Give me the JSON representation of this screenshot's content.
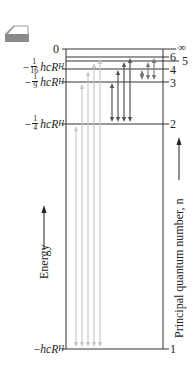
{
  "icon": {
    "name": "book-icon",
    "color": "#8a8a8a"
  },
  "diagram": {
    "frame": {
      "left": 66,
      "right": 163,
      "top": 49,
      "bottom": 349
    },
    "levels": [
      {
        "n": "∞",
        "energy_label": "0",
        "y": 49,
        "label_y": 43
      },
      {
        "n": "6",
        "energy_label": "",
        "y": 57,
        "label_y": 51
      },
      {
        "n": "5",
        "energy_label": "",
        "y": 61,
        "label_y": 56
      },
      {
        "n": "4",
        "energy_label": "−1/16 hcR_H",
        "y": 69,
        "label_y": 64
      },
      {
        "n": "3",
        "energy_label": "−1/9 hcR_H",
        "y": 82,
        "label_y": 77
      },
      {
        "n": "2",
        "energy_label": "−1/4 hcR_H",
        "y": 124,
        "label_y": 118
      },
      {
        "n": "1",
        "energy_label": "−hcR_H",
        "y": 349,
        "label_y": 343
      }
    ],
    "energy_labels": {
      "zero": "0",
      "n4": {
        "sign": "−",
        "num": "1",
        "den": "16",
        "text": "hcR",
        "sub": "H"
      },
      "n3": {
        "sign": "−",
        "num": "1",
        "den": "9",
        "text": "hcR",
        "sub": "H"
      },
      "n2": {
        "sign": "−",
        "num": "1",
        "den": "4",
        "text": "hcR",
        "sub": "H"
      },
      "n1": {
        "sign": "−",
        "text": "hcR",
        "sub": "H"
      }
    },
    "n_labels": {
      "inf": "∞",
      "n6": "6",
      "n5": "5",
      "n4": "4",
      "n3": "3",
      "n2": "2",
      "n1": "1"
    },
    "transitions": {
      "lyman": {
        "color": "#c8c8c8",
        "lower": 1,
        "uppers": [
          2,
          3,
          4,
          5,
          6
        ],
        "x": [
          76,
          82,
          88,
          94,
          100
        ]
      },
      "balmer": {
        "color": "#555555",
        "lower": 2,
        "uppers": [
          3,
          4,
          5,
          6
        ],
        "x": [
          112,
          118,
          124,
          130
        ]
      },
      "paschen": {
        "color": "#777777",
        "lower": 3,
        "uppers": [
          4,
          5,
          6
        ],
        "x": [
          142,
          148,
          154
        ]
      }
    },
    "axis_left_label": "Energy",
    "axis_right_label": "Principal quantum number, n"
  }
}
